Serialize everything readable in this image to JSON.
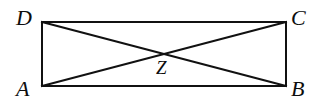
{
  "figure": {
    "type": "geometry-diagram",
    "shape": "rectangle-with-diagonals",
    "background_color": "#ffffff",
    "stroke_color": "#111111",
    "label_color": "#0d0d0d",
    "stroke_width": 2,
    "width": 331,
    "height": 105,
    "rectangle": {
      "left": 42,
      "top": 22,
      "right": 286,
      "bottom": 86
    },
    "points": {
      "A": {
        "label": "A",
        "x": 42,
        "y": 86,
        "role": "bottom-left-vertex"
      },
      "B": {
        "label": "B",
        "x": 286,
        "y": 86,
        "role": "bottom-right-vertex"
      },
      "C": {
        "label": "C",
        "x": 286,
        "y": 22,
        "role": "top-right-vertex"
      },
      "D": {
        "label": "D",
        "x": 42,
        "y": 22,
        "role": "top-left-vertex"
      },
      "Z": {
        "label": "Z",
        "x": 164,
        "y": 54,
        "role": "diagonal-intersection"
      }
    },
    "segments": [
      {
        "name": "side-DC",
        "from": "D",
        "to": "C"
      },
      {
        "name": "side-CB",
        "from": "C",
        "to": "B"
      },
      {
        "name": "side-BA",
        "from": "B",
        "to": "A"
      },
      {
        "name": "side-AD",
        "from": "A",
        "to": "D"
      },
      {
        "name": "diagonal-AC",
        "from": "A",
        "to": "C"
      },
      {
        "name": "diagonal-DB",
        "from": "D",
        "to": "B"
      }
    ]
  }
}
